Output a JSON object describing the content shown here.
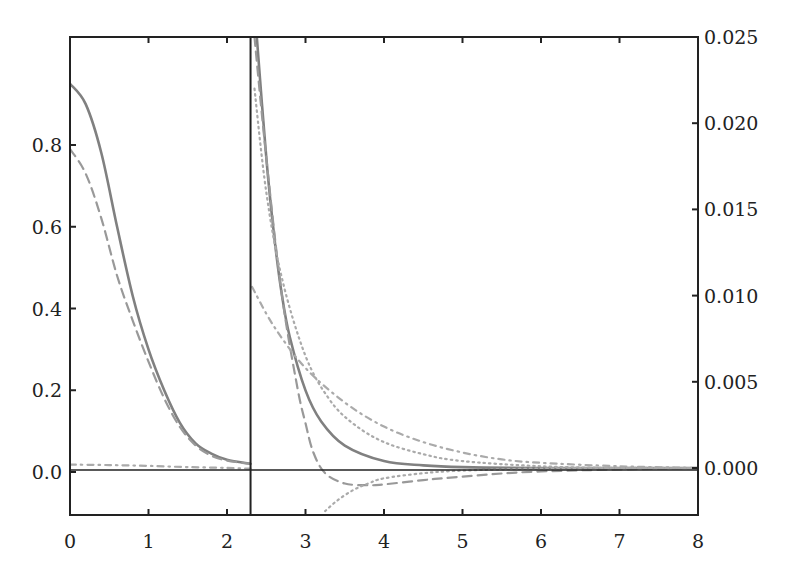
{
  "chart_data": {
    "type": "line",
    "title": "",
    "xlabel": "",
    "ylabel": "",
    "y2label": "",
    "xlim": [
      0,
      8
    ],
    "ylim": [
      -0.1,
      0.98
    ],
    "y2lim": [
      -0.0025,
      0.025
    ],
    "grid": false,
    "legend": "none",
    "x_ticks": [
      "0",
      "1",
      "2",
      "3",
      "4",
      "5",
      "6",
      "7",
      "8"
    ],
    "y_ticks": [
      "0.0",
      "0.2",
      "0.4",
      "0.6",
      "0.8"
    ],
    "y2_ticks": [
      "0.000",
      "0.005",
      "0.010",
      "0.015",
      "0.020",
      "0.025"
    ],
    "divider_x": 2.3,
    "annotations": [
      "vertical divider at x≈2.3 separating left-axis region (x<2.3) from right-axis region (x>2.3)",
      "horizontal zero baseline"
    ],
    "left_panel": {
      "axis": "left",
      "x_range": [
        0,
        2.3
      ],
      "series": [
        {
          "name": "solid",
          "style": "solid",
          "color": "#808080",
          "x": [
            0,
            0.2,
            0.4,
            0.6,
            0.8,
            1.0,
            1.2,
            1.4,
            1.6,
            1.8,
            2.0,
            2.3
          ],
          "y": [
            0.95,
            0.9,
            0.78,
            0.6,
            0.43,
            0.3,
            0.2,
            0.12,
            0.07,
            0.045,
            0.03,
            0.02
          ]
        },
        {
          "name": "dashed",
          "style": "dashed",
          "color": "#999999",
          "x": [
            0,
            0.2,
            0.4,
            0.6,
            0.8,
            1.0,
            1.2,
            1.4,
            1.6,
            1.8,
            2.0,
            2.3
          ],
          "y": [
            0.79,
            0.73,
            0.62,
            0.48,
            0.37,
            0.27,
            0.18,
            0.11,
            0.065,
            0.04,
            0.028,
            0.02
          ]
        },
        {
          "name": "dash-dot",
          "style": "dashdot",
          "color": "#aaaaaa",
          "x": [
            0,
            0.5,
            1.0,
            1.5,
            2.0,
            2.3
          ],
          "y": [
            0.018,
            0.017,
            0.015,
            0.012,
            0.01,
            0.008
          ]
        }
      ]
    },
    "right_panel": {
      "axis": "right",
      "x_range": [
        2.3,
        8
      ],
      "series": [
        {
          "name": "solid",
          "style": "solid",
          "color": "#808080",
          "x": [
            2.38,
            2.5,
            2.6,
            2.7,
            2.8,
            3.0,
            3.2,
            3.5,
            4.0,
            4.5,
            5.0,
            6.0,
            8.0
          ],
          "y": [
            0.025,
            0.018,
            0.0135,
            0.01,
            0.0076,
            0.0045,
            0.0027,
            0.0013,
            0.0004,
            0.00015,
            5e-05,
            0.0,
            0.0
          ]
        },
        {
          "name": "dashed",
          "style": "dashed",
          "color": "#999999",
          "x": [
            2.35,
            2.5,
            2.7,
            2.9,
            3.0,
            3.1,
            3.25,
            3.5,
            3.8,
            4.0,
            4.5,
            5.0,
            6.0,
            8.0
          ],
          "y": [
            0.025,
            0.018,
            0.01,
            0.0046,
            0.0026,
            0.0009,
            -0.0003,
            -0.0009,
            -0.001,
            -0.00095,
            -0.0007,
            -0.0005,
            -0.0002,
            0.0
          ]
        },
        {
          "name": "dotted",
          "style": "dotted",
          "color": "#aaaaaa",
          "x": [
            2.35,
            2.5,
            2.7,
            3.0,
            3.3,
            3.6,
            4.0,
            4.5,
            5.0,
            6.0,
            7.0,
            8.0
          ],
          "y": [
            0.022,
            0.016,
            0.011,
            0.0065,
            0.004,
            0.0026,
            0.0015,
            0.0008,
            0.0004,
            0.0001,
            0.0,
            0.0
          ]
        },
        {
          "name": "dash-dot",
          "style": "dashdot",
          "color": "#aaaaaa",
          "x": [
            2.32,
            2.6,
            3.0,
            3.5,
            4.0,
            4.5,
            5.0,
            5.5,
            6.0,
            7.0,
            8.0
          ],
          "y": [
            0.0105,
            0.0082,
            0.0058,
            0.0038,
            0.0024,
            0.0015,
            0.0009,
            0.0005,
            0.0003,
            0.0001,
            0.0
          ]
        },
        {
          "name": "dotted-negative",
          "style": "dotted",
          "color": "#aaaaaa",
          "x": [
            3.25,
            3.4,
            3.6,
            3.8,
            4.0,
            4.5,
            5.0,
            6.0,
            7.0,
            8.0
          ],
          "y": [
            -0.0025,
            -0.0019,
            -0.0013,
            -0.0009,
            -0.0006,
            -0.0003,
            -0.00015,
            -3e-05,
            0.0,
            0.0
          ]
        }
      ]
    }
  },
  "axes": {
    "x_ticks": [
      "0",
      "1",
      "2",
      "3",
      "4",
      "5",
      "6",
      "7",
      "8"
    ],
    "y_left_ticks": [
      "0.0",
      "0.2",
      "0.4",
      "0.6",
      "0.8"
    ],
    "y_right_ticks": [
      "0.000",
      "0.005",
      "0.010",
      "0.015",
      "0.020",
      "0.025"
    ]
  },
  "colors": {
    "axis": "#222222",
    "solid": "#808080",
    "dashed": "#999999",
    "dotted": "#aaaaaa",
    "dashdot": "#aaaaaa"
  }
}
